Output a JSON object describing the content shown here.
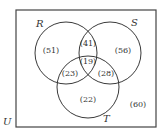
{
  "diagram": {
    "type": "venn",
    "universe": {
      "label": "U",
      "outside_value": "(60)"
    },
    "sets": {
      "R": {
        "label": "R"
      },
      "S": {
        "label": "S"
      },
      "T": {
        "label": "T"
      }
    },
    "regions": {
      "R_only": "(51)",
      "S_only": "(56)",
      "T_only": "(22)",
      "R_and_S_only": "(41)",
      "R_and_T_only": "(23)",
      "S_and_T_only": "(28)",
      "R_and_S_and_T": "(19)"
    },
    "colors": {
      "stroke": "#3a3a3a",
      "text": "#333333",
      "background": "#ffffff"
    }
  }
}
